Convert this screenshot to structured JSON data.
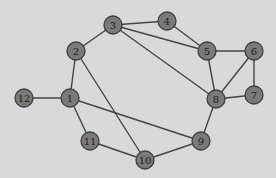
{
  "diagram": {
    "type": "undirected-graph",
    "style": {
      "background": "#d9d9d9",
      "node_fill": "#7a7a7a",
      "node_stroke": "#3e3e3e",
      "edge_color": "#454545",
      "label_color": "#1c1c1c",
      "node_radius": 9
    },
    "nodes": [
      {
        "id": "1",
        "label": "1",
        "x": 70,
        "y": 98
      },
      {
        "id": "2",
        "label": "2",
        "x": 76,
        "y": 51
      },
      {
        "id": "3",
        "label": "3",
        "x": 113,
        "y": 25
      },
      {
        "id": "4",
        "label": "4",
        "x": 167,
        "y": 21
      },
      {
        "id": "5",
        "label": "5",
        "x": 207,
        "y": 51
      },
      {
        "id": "6",
        "label": "6",
        "x": 254,
        "y": 51
      },
      {
        "id": "7",
        "label": "7",
        "x": 254,
        "y": 95
      },
      {
        "id": "8",
        "label": "8",
        "x": 216,
        "y": 99
      },
      {
        "id": "9",
        "label": "9",
        "x": 201,
        "y": 141
      },
      {
        "id": "10",
        "label": "10",
        "x": 145,
        "y": 160
      },
      {
        "id": "11",
        "label": "11",
        "x": 90,
        "y": 141
      },
      {
        "id": "12",
        "label": "12",
        "x": 24,
        "y": 98
      }
    ],
    "edges": [
      [
        "12",
        "1"
      ],
      [
        "1",
        "2"
      ],
      [
        "1",
        "11"
      ],
      [
        "1",
        "9"
      ],
      [
        "2",
        "3"
      ],
      [
        "2",
        "10"
      ],
      [
        "3",
        "4"
      ],
      [
        "3",
        "5"
      ],
      [
        "3",
        "8"
      ],
      [
        "4",
        "5"
      ],
      [
        "5",
        "6"
      ],
      [
        "5",
        "8"
      ],
      [
        "6",
        "8"
      ],
      [
        "6",
        "7"
      ],
      [
        "7",
        "8"
      ],
      [
        "8",
        "9"
      ],
      [
        "9",
        "10"
      ],
      [
        "10",
        "11"
      ]
    ]
  }
}
